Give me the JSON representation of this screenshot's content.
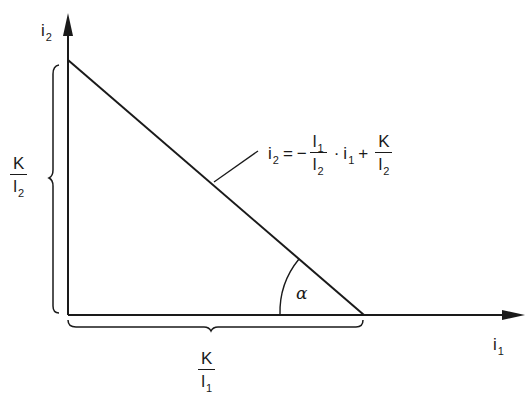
{
  "diagram": {
    "type": "budget-line / linear relation plot",
    "axes": {
      "x": {
        "label_main": "i",
        "label_sub": "1"
      },
      "y": {
        "label_main": "i",
        "label_sub": "2"
      }
    },
    "equation": {
      "lhs_main": "i",
      "lhs_sub": "2",
      "equals": "=",
      "minus": "−",
      "frac1_num_main": "l",
      "frac1_num_sub": "1",
      "frac1_den_main": "l",
      "frac1_den_sub": "2",
      "dot": "·",
      "var_main": "i",
      "var_sub": "1",
      "plus": "+",
      "frac2_num": "K",
      "frac2_den_main": "l",
      "frac2_den_sub": "2"
    },
    "y_intercept_label": {
      "num": "K",
      "den_main": "l",
      "den_sub": "2"
    },
    "x_intercept_label": {
      "num": "K",
      "den_main": "l",
      "den_sub": "1"
    },
    "angle_label": "α",
    "colors": {
      "line": "#1a1a1a",
      "background": "#ffffff"
    }
  }
}
